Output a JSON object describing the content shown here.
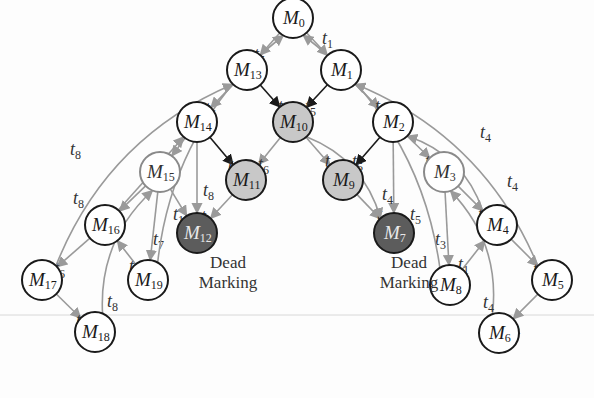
{
  "diagram": {
    "type": "reachability-graph",
    "colors": {
      "normal_stroke": "#1a1a1a",
      "gray_stroke": "#8a8a8a",
      "light_fill": "#c8c8c8",
      "dark_fill": "#5c5c5c",
      "edge": "#9a9a9a",
      "edge_dark": "#1a1a1a"
    },
    "nodes": [
      {
        "id": "M0",
        "label": "M",
        "sub": "0",
        "x": 293,
        "y": 18,
        "style": "normal"
      },
      {
        "id": "M1",
        "label": "M",
        "sub": "1",
        "x": 341,
        "y": 70,
        "style": "normal"
      },
      {
        "id": "M2",
        "label": "M",
        "sub": "2",
        "x": 393,
        "y": 122,
        "style": "normal"
      },
      {
        "id": "M3",
        "label": "M",
        "sub": "3",
        "x": 444,
        "y": 172,
        "style": "gray"
      },
      {
        "id": "M4",
        "label": "M",
        "sub": "4",
        "x": 497,
        "y": 225,
        "style": "normal"
      },
      {
        "id": "M5",
        "label": "M",
        "sub": "5",
        "x": 552,
        "y": 280,
        "style": "normal"
      },
      {
        "id": "M6",
        "label": "M",
        "sub": "6",
        "x": 499,
        "y": 333,
        "style": "normal"
      },
      {
        "id": "M7",
        "label": "M",
        "sub": "7",
        "x": 394,
        "y": 233,
        "style": "dark"
      },
      {
        "id": "M8",
        "label": "M",
        "sub": "8",
        "x": 450,
        "y": 285,
        "style": "normal"
      },
      {
        "id": "M9",
        "label": "M",
        "sub": "9",
        "x": 343,
        "y": 180,
        "style": "light"
      },
      {
        "id": "M10",
        "label": "M",
        "sub": "10",
        "x": 293,
        "y": 122,
        "style": "light"
      },
      {
        "id": "M11",
        "label": "M",
        "sub": "11",
        "x": 246,
        "y": 180,
        "style": "light"
      },
      {
        "id": "M12",
        "label": "M",
        "sub": "12",
        "x": 197,
        "y": 233,
        "style": "dark"
      },
      {
        "id": "M13",
        "label": "M",
        "sub": "13",
        "x": 247,
        "y": 70,
        "style": "normal"
      },
      {
        "id": "M14",
        "label": "M",
        "sub": "14",
        "x": 197,
        "y": 122,
        "style": "normal"
      },
      {
        "id": "M15",
        "label": "M",
        "sub": "15",
        "x": 160,
        "y": 172,
        "style": "gray"
      },
      {
        "id": "M16",
        "label": "M",
        "sub": "16",
        "x": 105,
        "y": 225,
        "style": "normal"
      },
      {
        "id": "M17",
        "label": "M",
        "sub": "17",
        "x": 42,
        "y": 280,
        "style": "normal"
      },
      {
        "id": "M18",
        "label": "M",
        "sub": "18",
        "x": 95,
        "y": 332,
        "style": "normal"
      },
      {
        "id": "M19",
        "label": "M",
        "sub": "19",
        "x": 148,
        "y": 280,
        "style": "normal"
      }
    ],
    "edges": [
      {
        "from": "M0",
        "to": "M1",
        "label": "t",
        "sub": "1",
        "lx": 322,
        "ly": 44
      },
      {
        "from": "M0",
        "to": "M13",
        "label": "t",
        "sub": "5",
        "lx": 254,
        "ly": 60
      },
      {
        "from": "M1",
        "to": "M2",
        "label": "t",
        "sub": "2",
        "lx": 375,
        "ly": 112
      },
      {
        "from": "M1",
        "to": "M10",
        "label": "t",
        "sub": "5",
        "lx": 305,
        "ly": 112,
        "dark": true
      },
      {
        "from": "M13",
        "to": "M10",
        "label": "t",
        "sub": "1",
        "lx": 278,
        "ly": 112,
        "dark": true
      },
      {
        "from": "M13",
        "to": "M14",
        "label": "t",
        "sub": "6",
        "lx": 205,
        "ly": 114
      },
      {
        "from": "M2",
        "to": "M3",
        "label": "t",
        "sub": "1",
        "lx": 425,
        "ly": 167
      },
      {
        "from": "M2",
        "to": "M9",
        "label": "t",
        "sub": "5",
        "lx": 352,
        "ly": 167,
        "dark": true
      },
      {
        "from": "M10",
        "to": "M9",
        "label": "t",
        "sub": "2",
        "lx": 325,
        "ly": 167
      },
      {
        "from": "M10",
        "to": "M11",
        "label": "t",
        "sub": "6",
        "lx": 258,
        "ly": 170
      },
      {
        "from": "M14",
        "to": "M11",
        "label": "t",
        "sub": "1",
        "lx": 228,
        "ly": 170,
        "dark": true
      },
      {
        "from": "M14",
        "to": "M15",
        "label": "t",
        "sub": "5",
        "lx": 155,
        "ly": 172
      },
      {
        "from": "M3",
        "to": "M4",
        "label": "t",
        "sub": "3",
        "lx": 478,
        "ly": 220
      },
      {
        "from": "M9",
        "to": "M7",
        "label": "t",
        "sub": "1",
        "lx": 377,
        "ly": 220
      },
      {
        "from": "M2",
        "to": "M7",
        "label": "t",
        "sub": "4",
        "lx": 382,
        "ly": 200
      },
      {
        "from": "M10",
        "to": "M7",
        "label": "t",
        "sub": "5",
        "lx": 410,
        "ly": 220
      },
      {
        "from": "M11",
        "to": "M12",
        "label": "t",
        "sub": "5",
        "lx": 201,
        "ly": 222
      },
      {
        "from": "M15",
        "to": "M12",
        "label": "t",
        "sub": "1",
        "lx": 173,
        "ly": 220
      },
      {
        "from": "M14",
        "to": "M12",
        "label": "t",
        "sub": "8",
        "lx": 203,
        "ly": 196
      },
      {
        "from": "M15",
        "to": "M16",
        "label": "t",
        "sub": "7",
        "lx": 101,
        "ly": 222
      },
      {
        "from": "M15",
        "to": "M19",
        "label": "t",
        "sub": "7",
        "lx": 153,
        "ly": 245
      },
      {
        "from": "M16",
        "to": "M17",
        "label": "t",
        "sub": "6",
        "lx": 54,
        "ly": 274
      },
      {
        "from": "M19",
        "to": "M16",
        "label": "t",
        "sub": "5",
        "lx": 129,
        "ly": 272
      },
      {
        "from": "M17",
        "to": "M18",
        "label": "t",
        "sub": "5",
        "lx": 76,
        "ly": 326
      },
      {
        "from": "M18",
        "to": "M15",
        "label": "t",
        "sub": "8",
        "lx": 107,
        "ly": 307
      },
      {
        "from": "M4",
        "to": "M5",
        "label": "t",
        "sub": "2",
        "lx": 533,
        "ly": 275
      },
      {
        "from": "M5",
        "to": "M6",
        "label": "t",
        "sub": "1",
        "lx": 510,
        "ly": 330
      },
      {
        "from": "M8",
        "to": "M4",
        "label": "t",
        "sub": "1",
        "lx": 458,
        "ly": 270
      },
      {
        "from": "M3",
        "to": "M8",
        "label": "t",
        "sub": "3",
        "lx": 435,
        "ly": 245
      },
      {
        "from": "M6",
        "to": "M3",
        "label": "t",
        "sub": "4",
        "lx": 483,
        "ly": 308
      },
      {
        "from": "M8",
        "to": "M0",
        "label": "",
        "sub": ""
      },
      {
        "from": "M19",
        "to": "M0",
        "label": "",
        "sub": ""
      },
      {
        "from": "M5",
        "to": "M1",
        "label": "t",
        "sub": "4",
        "lx": 480,
        "ly": 138
      },
      {
        "from": "M4",
        "to": "M2",
        "label": "t",
        "sub": "4",
        "lx": 507,
        "ly": 187
      },
      {
        "from": "M17",
        "to": "M13",
        "label": "t",
        "sub": "8",
        "lx": 70,
        "ly": 155
      },
      {
        "from": "M16",
        "to": "M14",
        "label": "t",
        "sub": "8",
        "lx": 73,
        "ly": 204
      }
    ],
    "captions": [
      {
        "id": "dead-left",
        "lines": [
          "Dead",
          "Marking"
        ],
        "x": 228,
        "y": 268
      },
      {
        "id": "dead-right",
        "lines": [
          "Dead",
          "Marking"
        ],
        "x": 409,
        "y": 268
      }
    ]
  }
}
